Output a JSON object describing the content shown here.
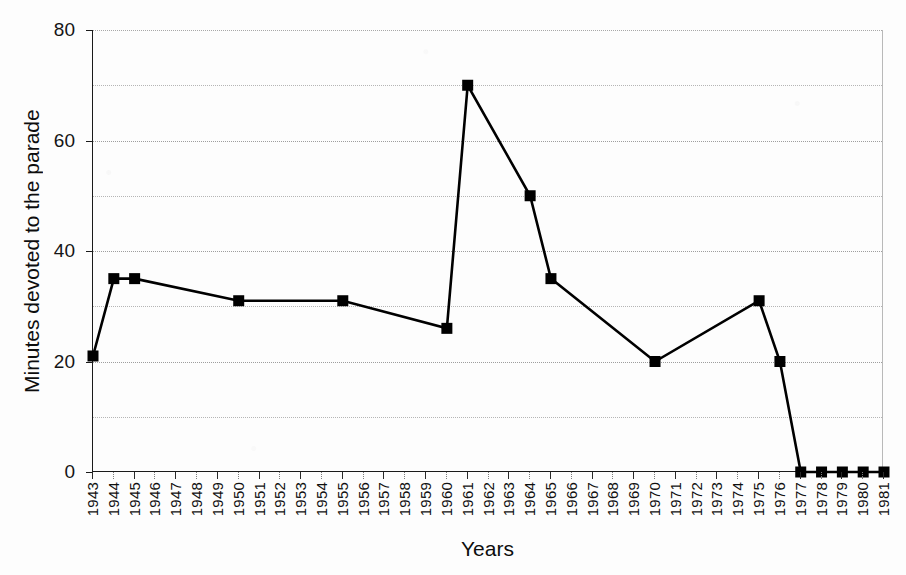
{
  "chart_data": {
    "type": "line",
    "title": "",
    "xlabel": "Years",
    "ylabel": "Minutes devoted to the parade",
    "xlim": [
      1943,
      1981
    ],
    "ylim": [
      0,
      80
    ],
    "yticks": [
      0,
      20,
      40,
      60,
      80
    ],
    "ytick_labels": [
      "0",
      "20",
      "40",
      "60",
      "80"
    ],
    "y_minor_gridlines": [
      10,
      30,
      50,
      70
    ],
    "grid": true,
    "legend": false,
    "marker": "square",
    "marker_color": "#000000",
    "line_color": "#000000",
    "categories": [
      "1943",
      "1944",
      "1945",
      "1946",
      "1947",
      "1948",
      "1949",
      "1950",
      "1951",
      "1952",
      "1953",
      "1954",
      "1955",
      "1956",
      "1957",
      "1958",
      "1959",
      "1960",
      "1961",
      "1962",
      "1963",
      "1964",
      "1965",
      "1966",
      "1967",
      "1968",
      "1969",
      "1970",
      "1971",
      "1972",
      "1973",
      "1974",
      "1975",
      "1976",
      "1977",
      "1978",
      "1979",
      "1980",
      "1981"
    ],
    "points": [
      {
        "x": 1943,
        "y": 21
      },
      {
        "x": 1944,
        "y": 35
      },
      {
        "x": 1945,
        "y": 35
      },
      {
        "x": 1950,
        "y": 31
      },
      {
        "x": 1955,
        "y": 31
      },
      {
        "x": 1960,
        "y": 26
      },
      {
        "x": 1961,
        "y": 70
      },
      {
        "x": 1964,
        "y": 50
      },
      {
        "x": 1965,
        "y": 35
      },
      {
        "x": 1970,
        "y": 20
      },
      {
        "x": 1975,
        "y": 31
      },
      {
        "x": 1976,
        "y": 20
      },
      {
        "x": 1977,
        "y": 0
      },
      {
        "x": 1978,
        "y": 0
      },
      {
        "x": 1979,
        "y": 0
      },
      {
        "x": 1980,
        "y": 0
      },
      {
        "x": 1981,
        "y": 0
      }
    ]
  },
  "figure": {
    "cut_off_title_fragment": "",
    "background_color": "#fdfdfd",
    "axis_color": "#1a1a1a",
    "gridline_color": "#b5b5b5"
  }
}
